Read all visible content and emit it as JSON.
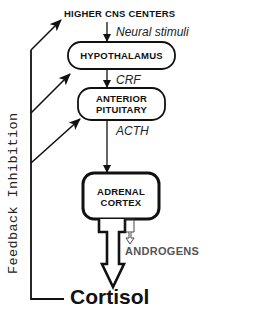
{
  "diagram": {
    "nodes": {
      "higher_cns": "HIGHER CNS CENTERS",
      "hypothalamus": "HYPOTHALAMUS",
      "anterior_pituitary_line1": "ANTERIOR",
      "anterior_pituitary_line2": "PITUITARY",
      "adrenal_cortex_line1": "ADRENAL",
      "adrenal_cortex_line2": "CORTEX",
      "cortisol": "Cortisol",
      "androgens": "ANDROGENS"
    },
    "edges": {
      "cns_to_hypothalamus": "Neural stimuli",
      "hypothalamus_to_pituitary": "CRF",
      "pituitary_to_adrenal": "ACTH"
    },
    "feedback_label": "Feedback Inhibition",
    "colors": {
      "line": "#111111",
      "androgens_text": "#555555",
      "background": "#ffffff"
    }
  }
}
